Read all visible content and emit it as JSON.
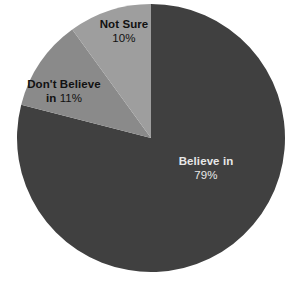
{
  "chart_data": {
    "type": "pie",
    "title": "",
    "subtitle": "",
    "xlabel": "",
    "ylabel": "",
    "legend": "none",
    "grid": false,
    "start_angle_deg": 0,
    "direction": "clockwise",
    "categories": [
      "Believe in",
      "Don't Believe in",
      "Not Sure"
    ],
    "values": [
      79,
      11,
      10
    ],
    "units": "percent",
    "slices": [
      {
        "name": "Believe in",
        "label_name": "Believe in",
        "label_value": "79%",
        "value": 79,
        "percent_text": "79%",
        "color": "#404040",
        "label_color": "#e8e8e8",
        "sweep_deg": 284.4,
        "start_deg": 0
      },
      {
        "name": "Don't Believe in",
        "label_name": "Don't Believe",
        "label_value": "in 11%",
        "label_value_bold": "in",
        "label_value_regular": "11%",
        "value": 11,
        "percent_text": "11%",
        "color": "#8a8a8a",
        "label_color": "#111111",
        "sweep_deg": 39.6,
        "start_deg": 284.4
      },
      {
        "name": "Not Sure",
        "label_name": "Not Sure",
        "label_value": "10%",
        "value": 10,
        "percent_text": "10%",
        "color": "#9e9e9e",
        "label_color": "#111111",
        "sweep_deg": 36.0,
        "start_deg": 324.0
      }
    ]
  },
  "canvas": {
    "background": "#ffffff",
    "center_x": 151,
    "center_y": 138,
    "radius": 134
  }
}
